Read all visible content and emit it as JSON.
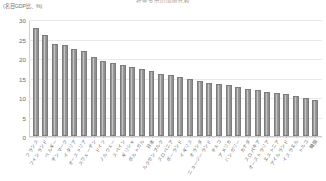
{
  "chart_title": "社会支出の国際比較",
  "y_axis_caption": "(名目GDP比、%)",
  "colors": {
    "bar": "#8e8e8e",
    "bar_highlight": "#cfcfcf",
    "gridline": "#e9e9e9",
    "axis": "#c9c9c9",
    "tick_text": "#6b6b6b",
    "caption_text": "#6f6f6f",
    "background": "#ffffff"
  },
  "chart_data": {
    "type": "bar",
    "title": "社会支出の国際比較",
    "xlabel": "",
    "ylabel": "(名目GDP比、%)",
    "ylim": [
      0,
      30
    ],
    "yticks": [
      0,
      5,
      10,
      15,
      20,
      25,
      30
    ],
    "grid": true,
    "legend": "none",
    "sorted": "descending",
    "categories": [
      "フランス",
      "フィンランド",
      "ベルギー",
      "デンマーク",
      "イタリア",
      "オーストリア",
      "スウェーデン",
      "ドイツ",
      "ノルウェー",
      "スペイン",
      "ギリシャ",
      "ポルトガル",
      "日本",
      "ルクセンブルク",
      "スロベニア",
      "ポーランド",
      "イギリス",
      "オランダ",
      "ニュージーランド",
      "チェコ",
      "アメリカ",
      "ハンガリー",
      "カナダ",
      "スロバキア",
      "オーストラリア",
      "エストニア",
      "アイルランド",
      "イスラエル",
      "トルコ",
      "韓国"
    ],
    "values": [
      28.0,
      26.2,
      23.8,
      23.5,
      22.5,
      22.0,
      20.5,
      19.5,
      18.8,
      18.3,
      17.8,
      17.3,
      16.8,
      16.0,
      15.8,
      15.3,
      14.8,
      14.3,
      13.8,
      13.5,
      13.2,
      12.8,
      12.2,
      11.8,
      11.5,
      11.2,
      10.8,
      10.3,
      9.8,
      9.3
    ],
    "values_tail_note": "末尾の数値は5〜7%まで低下",
    "unit": "%"
  }
}
